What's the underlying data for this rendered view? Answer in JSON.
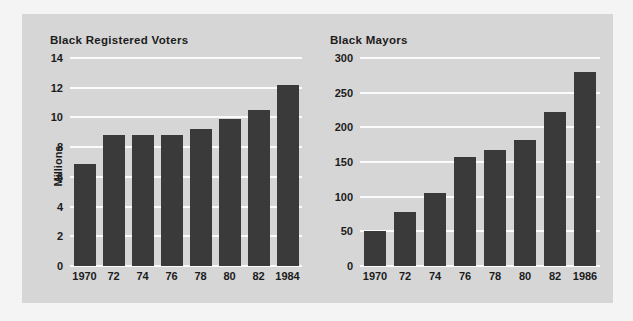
{
  "figure": {
    "background_color": "#f4f4f4",
    "panel_color": "#d6d6d6",
    "bar_color": "#3a3a3a",
    "gridline_color": "#fbfbfb",
    "text_color": "#1c1c1c"
  },
  "chart_data": [
    {
      "id": "black-registered-voters",
      "type": "bar",
      "title": "Black Registered Voters",
      "xlabel": "",
      "ylabel": "Millions",
      "categories": [
        "1970",
        "72",
        "74",
        "76",
        "78",
        "80",
        "82",
        "1984"
      ],
      "values": [
        6.9,
        8.8,
        8.8,
        8.8,
        9.2,
        9.9,
        10.5,
        12.2
      ],
      "ylim": [
        0,
        14
      ],
      "yticks": [
        0,
        2,
        4,
        6,
        8,
        10,
        12,
        14
      ],
      "ytick_labels": [
        "0",
        "2",
        "4",
        "6",
        "8",
        "10",
        "12",
        "14"
      ],
      "grid": true,
      "legend": "none"
    },
    {
      "id": "black-mayors",
      "type": "bar",
      "title": "Black Mayors",
      "xlabel": "",
      "ylabel": "",
      "categories": [
        "1970",
        "72",
        "74",
        "76",
        "78",
        "80",
        "82",
        "1986"
      ],
      "values": [
        50,
        78,
        106,
        157,
        167,
        182,
        222,
        280
      ],
      "ylim": [
        0,
        300
      ],
      "yticks": [
        0,
        50,
        100,
        150,
        200,
        250,
        300
      ],
      "ytick_labels": [
        "0",
        "50",
        "100",
        "150",
        "200",
        "250",
        "300"
      ],
      "grid": true,
      "legend": "none"
    }
  ]
}
